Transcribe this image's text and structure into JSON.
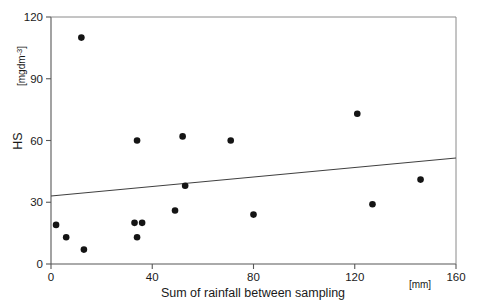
{
  "chart_data": {
    "type": "scatter",
    "title": "",
    "xlabel": "Sum of rainfall between sampling",
    "xunit": "[mm]",
    "ylabel": "HS",
    "yunit_prefix": "[mgdm",
    "yunit_sup": "-3",
    "yunit_suffix": "]",
    "xlim": [
      0,
      160
    ],
    "ylim": [
      0,
      120
    ],
    "xticks": [
      0,
      40,
      80,
      120,
      160
    ],
    "yticks": [
      0,
      30,
      60,
      90,
      120
    ],
    "xtick_labels": [
      "0",
      "40",
      "80",
      "120",
      "160"
    ],
    "ytick_labels": [
      "0",
      "30",
      "60",
      "90",
      "120"
    ],
    "grid": false,
    "legend": "none",
    "points": [
      {
        "x": 2,
        "y": 19
      },
      {
        "x": 6,
        "y": 13
      },
      {
        "x": 12,
        "y": 110
      },
      {
        "x": 13,
        "y": 7
      },
      {
        "x": 33,
        "y": 20
      },
      {
        "x": 34,
        "y": 13
      },
      {
        "x": 34,
        "y": 60
      },
      {
        "x": 36,
        "y": 20
      },
      {
        "x": 49,
        "y": 26
      },
      {
        "x": 52,
        "y": 62
      },
      {
        "x": 53,
        "y": 38
      },
      {
        "x": 71,
        "y": 60
      },
      {
        "x": 80,
        "y": 24
      },
      {
        "x": 121,
        "y": 73
      },
      {
        "x": 127,
        "y": 29
      },
      {
        "x": 146,
        "y": 41
      }
    ],
    "trendline": {
      "x_start": 0,
      "y_start": 33,
      "x_end": 160,
      "y_end": 51.5
    }
  }
}
